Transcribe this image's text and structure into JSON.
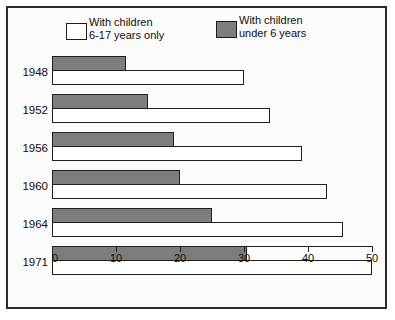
{
  "legend": {
    "entries": [
      {
        "swatch": "white-swatch-icon",
        "line1": "With children",
        "line2": "6-17 years only"
      },
      {
        "swatch": "dark-swatch-icon",
        "line1": "With children",
        "line2": "under 6 years"
      }
    ]
  },
  "axis": {
    "ticks": [
      "0",
      "10",
      "20",
      "30",
      "40",
      "50"
    ]
  },
  "groups": [
    {
      "year": "1948",
      "dark": 11.5,
      "white": 30.0
    },
    {
      "year": "1952",
      "dark": 15.0,
      "white": 34.0
    },
    {
      "year": "1956",
      "dark": 19.0,
      "white": 39.0
    },
    {
      "year": "1960",
      "dark": 20.0,
      "white": 43.0
    },
    {
      "year": "1964",
      "dark": 25.0,
      "white": 45.5
    },
    {
      "year": "1971",
      "dark": 30.5,
      "white": 50.0
    }
  ],
  "colors": {
    "dark_bar": "#7d7d7d",
    "white_bar": "#ffffff",
    "outline": "#1f1f1f",
    "frame": "#2b2b2b",
    "background": "#fbfbfb"
  },
  "chart_data": {
    "type": "bar",
    "title": "",
    "subtitle": "",
    "xlabel": "",
    "ylabel": "",
    "orientation": "horizontal",
    "grid": false,
    "legend_position": "top",
    "xlim": [
      0,
      50
    ],
    "xticks": [
      0,
      10,
      20,
      30,
      40,
      50
    ],
    "categories": [
      "1948",
      "1952",
      "1956",
      "1960",
      "1964",
      "1971"
    ],
    "series": [
      {
        "name": "With children under 6 years",
        "values": [
          11.5,
          15.0,
          19.0,
          20.0,
          25.0,
          30.5
        ],
        "color": "#7d7d7d"
      },
      {
        "name": "With children 6-17 years only",
        "values": [
          30.0,
          34.0,
          39.0,
          43.0,
          45.5,
          50.0
        ],
        "color": "#ffffff"
      }
    ]
  }
}
